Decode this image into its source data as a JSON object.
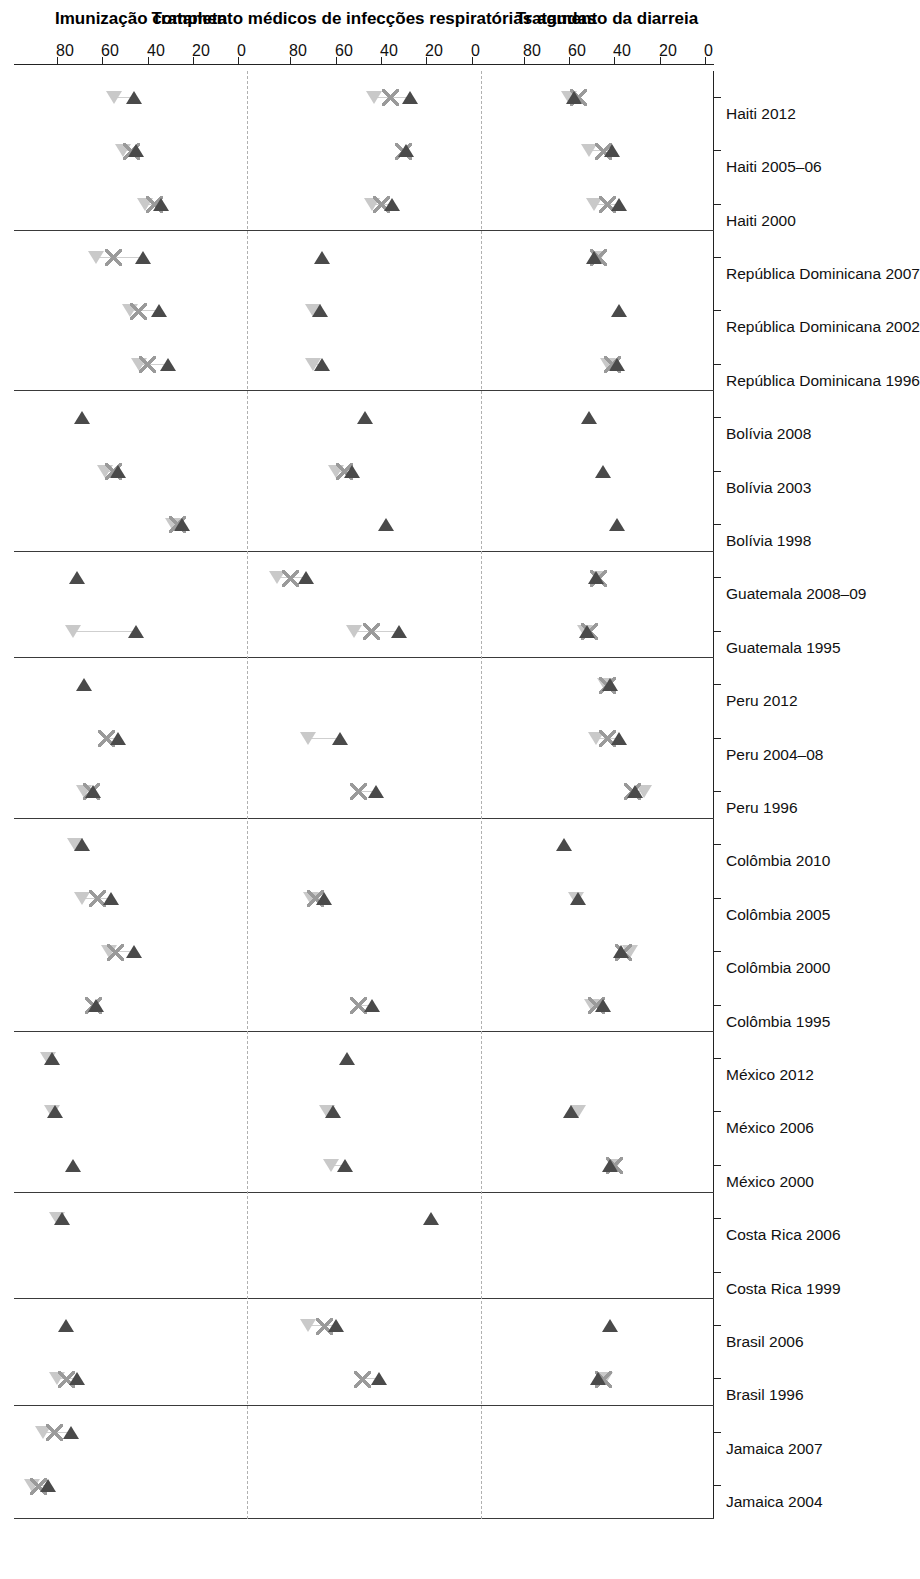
{
  "chart_data": {
    "type": "scatter",
    "title": "",
    "orientation": "rotated-90",
    "xlabel": "",
    "ylabel": "",
    "axis_ticks": [
      0,
      20,
      40,
      60,
      80
    ],
    "panel_axis_max": 95,
    "panels": [
      {
        "label": "Imunização completa"
      },
      {
        "label": "Tratamento médicos de infecções respiratórias agudas"
      },
      {
        "label": "Tratamento da diarreia"
      }
    ],
    "legend": {
      "position": "bottom",
      "entries": [
        {
          "label": "40% mais pobres",
          "marker": "triangle-dark",
          "color": "#4a4a4a"
        },
        {
          "label": "Média",
          "marker": "cross",
          "color": "#9a9a9a"
        },
        {
          "label": "60% mais ricos",
          "marker": "triangle-light",
          "color": "#c9c9c9"
        }
      ]
    },
    "groups": [
      {
        "name": "Jamaica",
        "categories": [
          "Jamaica 2004",
          "Jamaica 2007"
        ]
      },
      {
        "name": "Brasil",
        "categories": [
          "Brasil 1996",
          "Brasil 2006"
        ]
      },
      {
        "name": "Costa Rica",
        "categories": [
          "Costa Rica 1999",
          "Costa Rica 2006"
        ]
      },
      {
        "name": "México",
        "categories": [
          "México 2000",
          "México 2006",
          "México 2012"
        ]
      },
      {
        "name": "Colômbia",
        "categories": [
          "Colômbia 1995",
          "Colômbia 2000",
          "Colômbia 2005",
          "Colômbia 2010"
        ]
      },
      {
        "name": "Peru",
        "categories": [
          "Peru 1996",
          "Peru 2004–08",
          "Peru 2012"
        ]
      },
      {
        "name": "Guatemala",
        "categories": [
          "Guatemala 1995",
          "Guatemala 2008–09"
        ]
      },
      {
        "name": "Bolívia",
        "categories": [
          "Bolívia 1998",
          "Bolívia 2003",
          "Bolívia 2008"
        ]
      },
      {
        "name": "República Dominicana",
        "categories": [
          "República Dominicana 1996",
          "República Dominicana 2002",
          "República Dominicana 2007"
        ]
      },
      {
        "name": "Haiti",
        "categories": [
          "Haiti 2000",
          "Haiti 2005–06",
          "Haiti 2012"
        ]
      }
    ],
    "categories": [
      "Jamaica 2004",
      "Jamaica 2007",
      "Brasil 1996",
      "Brasil 2006",
      "Costa Rica 1999",
      "Costa Rica 2006",
      "México 2000",
      "México 2006",
      "México 2012",
      "Colômbia 1995",
      "Colômbia 2000",
      "Colômbia 2005",
      "Colômbia 2010",
      "Peru 1996",
      "Peru 2004–08",
      "Peru 2012",
      "Guatemala 1995",
      "Guatemala 2008–09",
      "Bolívia 1998",
      "Bolívia 2003",
      "Bolívia 2008",
      "República Dominicana 1996",
      "República Dominicana 2002",
      "República Dominicana 2007",
      "Haiti 2000",
      "Haiti 2005–06",
      "Haiti 2012"
    ],
    "series_by_panel": {
      "Imunização completa": {
        "poor": [
          84,
          74,
          71,
          76,
          null,
          78,
          73,
          81,
          82,
          63,
          46,
          56,
          69,
          64,
          53,
          68,
          45,
          71,
          25,
          53,
          69,
          31,
          35,
          42,
          34,
          45,
          46
        ],
        "mean": [
          88,
          81,
          76,
          null,
          null,
          null,
          null,
          null,
          null,
          64,
          54,
          62,
          null,
          65,
          58,
          null,
          null,
          null,
          27,
          55,
          null,
          40,
          44,
          55,
          37,
          47,
          null
        ],
        "rich": [
          91,
          86,
          80,
          null,
          null,
          80,
          null,
          82,
          84,
          null,
          57,
          69,
          72,
          68,
          null,
          null,
          73,
          null,
          29,
          59,
          null,
          44,
          48,
          63,
          41,
          51,
          55
        ]
      },
      "Tratamento médicos de infecções respiratórias agudas": {
        "poor": [
          null,
          null,
          41,
          60,
          null,
          18,
          56,
          61,
          55,
          44,
          null,
          65,
          null,
          42,
          58,
          null,
          32,
          73,
          38,
          53,
          47,
          66,
          67,
          66,
          35,
          29,
          27
        ],
        "mean": [
          null,
          null,
          48,
          65,
          null,
          null,
          null,
          null,
          null,
          50,
          null,
          69,
          null,
          50,
          null,
          null,
          44,
          80,
          null,
          56,
          null,
          null,
          null,
          null,
          40,
          30,
          36
        ],
        "rich": [
          null,
          null,
          null,
          72,
          null,
          null,
          62,
          64,
          null,
          null,
          null,
          71,
          null,
          null,
          72,
          null,
          52,
          86,
          null,
          60,
          null,
          70,
          70,
          null,
          44,
          null,
          43
        ]
      },
      "Tratamento da diarreia": {
        "poor": [
          null,
          null,
          47,
          42,
          null,
          null,
          42,
          59,
          null,
          45,
          37,
          56,
          62,
          31,
          38,
          42,
          52,
          48,
          39,
          45,
          51,
          39,
          38,
          49,
          38,
          41,
          58
        ],
        "mean": [
          null,
          null,
          45,
          null,
          null,
          null,
          40,
          null,
          null,
          48,
          36,
          null,
          null,
          32,
          43,
          43,
          51,
          47,
          null,
          null,
          null,
          41,
          null,
          47,
          43,
          45,
          56
        ],
        "rich": [
          null,
          null,
          44,
          null,
          null,
          null,
          40,
          56,
          null,
          50,
          33,
          57,
          null,
          27,
          48,
          44,
          53,
          47,
          null,
          null,
          null,
          43,
          null,
          47,
          49,
          51,
          60
        ]
      }
    }
  },
  "axis": {
    "tick_labels": [
      "0",
      "20",
      "40",
      "60",
      "80"
    ],
    "zero_label": "0"
  }
}
